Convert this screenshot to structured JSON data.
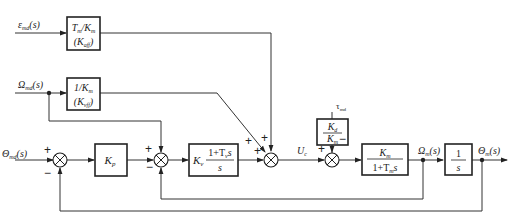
{
  "diagram": {
    "type": "control-block-diagram",
    "inputs": {
      "epsilon": "ε_md(s)",
      "omega": "Ω_md(s)",
      "theta": "Θ_md(s)",
      "tau": "τ_md"
    },
    "outputs": {
      "omega_m": "Ω_m(s)",
      "theta_m": "Θ_m(s)"
    },
    "signals": {
      "uc": "U_c"
    },
    "blocks": [
      {
        "id": "accel_ff",
        "line1": "T_m/K_m",
        "line2": "(K_aff)"
      },
      {
        "id": "vel_ff",
        "line1": "1/K_m",
        "line2": "(K_vff)"
      },
      {
        "id": "kp",
        "label": "K_p"
      },
      {
        "id": "kv",
        "label": "K_v (1+T_v s)/s"
      },
      {
        "id": "kd",
        "num": "K_d",
        "den": "K_m"
      },
      {
        "id": "motor",
        "num": "K_m",
        "den": "1+T_m s"
      },
      {
        "id": "integrator",
        "num": "1",
        "den": "s"
      }
    ],
    "summing_junctions": [
      {
        "id": "sum1",
        "signs": [
          "+",
          "−"
        ]
      },
      {
        "id": "sum2",
        "signs": [
          "+",
          "+",
          "−"
        ]
      },
      {
        "id": "sum3",
        "signs": [
          "+",
          "+",
          "+"
        ]
      },
      {
        "id": "sum4",
        "signs": [
          "+",
          "−"
        ]
      }
    ]
  },
  "labels": {
    "eps_main": "ε",
    "eps_sub": "md",
    "eps_arg": "(s)",
    "omg_main": "Ω",
    "omg_sub": "md",
    "omg_arg": "(s)",
    "th_main": "Θ",
    "th_sub": "md",
    "th_arg": "(s)",
    "tau_main": "τ",
    "tau_sub": "md",
    "uc_main": "U",
    "uc_sub": "c",
    "om_main": "Ω",
    "om_sub": "m",
    "om_arg": "(s)",
    "thm_main": "Θ",
    "thm_sub": "m",
    "thm_arg": "(s)",
    "aff_l1_a": "T",
    "aff_l1_a_sub": "m",
    "aff_l1_b": "/K",
    "aff_l1_b_sub": "m",
    "aff_l2_a": "(K",
    "aff_l2_sub": "aff",
    "aff_l2_b": ")",
    "vff_l1_a": "1/K",
    "vff_l1_sub": "m",
    "vff_l2_a": "(K",
    "vff_l2_sub": "vff",
    "vff_l2_b": ")",
    "kp_main": "K",
    "kp_sub": "p",
    "kv_main": "K",
    "kv_sub": "v",
    "kv_num": "1+T",
    "kv_num_sub": "v",
    "kv_num_s": "s",
    "kv_den": "s",
    "kd_num": "K",
    "kd_num_sub": "d",
    "kd_den": "K",
    "kd_den_sub": "m",
    "mot_num": "K",
    "mot_num_sub": "m",
    "mot_den": "1+T",
    "mot_den_sub": "m",
    "mot_den_s": "s",
    "int_num": "1",
    "int_den": "s",
    "plus": "+",
    "minus": "−"
  }
}
